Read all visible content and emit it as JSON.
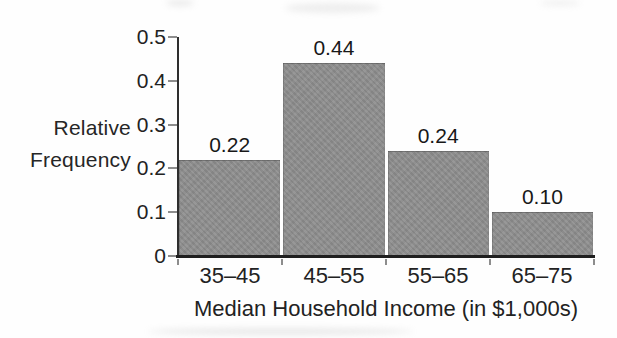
{
  "chart_data": {
    "type": "bar",
    "title": "",
    "ylabel": "Relative Frequency",
    "ylabel_lines": [
      "Relative",
      "Frequency"
    ],
    "xlabel": "Median Household Income (in $1,000s)",
    "categories": [
      "35–45",
      "45–55",
      "55–65",
      "65–75"
    ],
    "values": [
      0.22,
      0.44,
      0.24,
      0.1
    ],
    "value_labels": [
      "0.22",
      "0.44",
      "0.24",
      "0.10"
    ],
    "ylim": [
      0,
      0.5
    ],
    "yticks": [
      {
        "value": 0,
        "label": "0"
      },
      {
        "value": 0.1,
        "label": "0.1"
      },
      {
        "value": 0.2,
        "label": "0.2"
      },
      {
        "value": 0.3,
        "label": "0.3"
      },
      {
        "value": 0.4,
        "label": "0.4"
      },
      {
        "value": 0.5,
        "label": "0.5"
      }
    ],
    "grid": false,
    "legend": "none",
    "layout_hints": {
      "bar_gap": "narrow white gap between adjacent bars",
      "value_labels_position": "above each bar"
    },
    "colors": {
      "bar_fill": "#8e8e8e",
      "axis": "#2e2e2e",
      "tick": "#8d8d8d",
      "text": "#1c1c1c",
      "background": "#ffffff"
    }
  }
}
